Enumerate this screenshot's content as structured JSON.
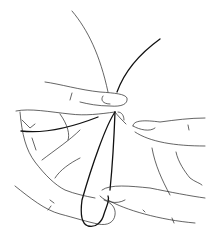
{
  "image": {
    "description": "Line drawing of two hands holding a loop of thread between fingers",
    "colors": {
      "background": "#ffffff",
      "line": "#222222",
      "thread": "#111111"
    }
  }
}
